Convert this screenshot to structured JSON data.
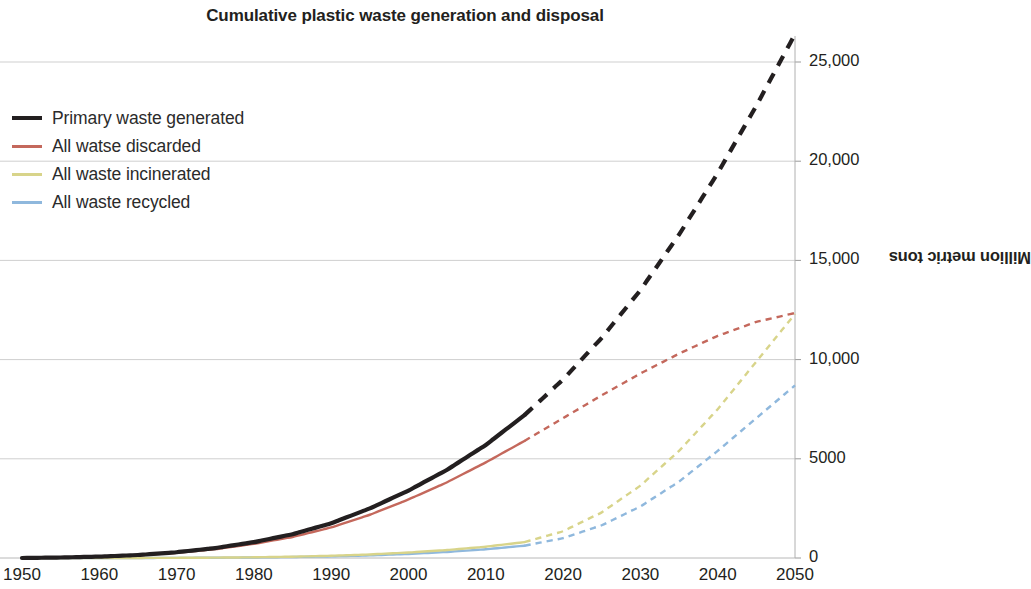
{
  "chart_data": {
    "type": "line",
    "title": "Cumulative plastic waste generation and disposal",
    "xlabel": "",
    "ylabel": "Million metric tons",
    "xlim": [
      1950,
      2050
    ],
    "ylim": [
      0,
      27000
    ],
    "grid": true,
    "legend_position": "top-left",
    "x_ticks": [
      "1950",
      "1960",
      "1970",
      "1980",
      "1990",
      "2000",
      "2010",
      "2020",
      "2030",
      "2040",
      "2050"
    ],
    "x_tick_values": [
      1950,
      1960,
      1970,
      1980,
      1990,
      2000,
      2010,
      2020,
      2030,
      2040,
      2050
    ],
    "y_ticks": [
      "0",
      "5000",
      "10,000",
      "15,000",
      "20,000",
      "25,000"
    ],
    "y_tick_values": [
      0,
      5000,
      10000,
      15000,
      20000,
      25000
    ],
    "historical_end_year": 2015,
    "note": "Solid segments are historical (1950-2015); dashed segments are projections (2015-2050).",
    "x": [
      1950,
      1955,
      1960,
      1965,
      1970,
      1975,
      1980,
      1985,
      1990,
      1995,
      2000,
      2005,
      2010,
      2015,
      2020,
      2025,
      2030,
      2035,
      2040,
      2045,
      2050
    ],
    "series": [
      {
        "name": "Primary waste generated",
        "color": "#231f20",
        "width": 4.2,
        "values": [
          0,
          25,
          70,
          150,
          290,
          500,
          800,
          1200,
          1750,
          2500,
          3400,
          4450,
          5700,
          7200,
          9000,
          11100,
          13500,
          16300,
          19400,
          22800,
          26400
        ]
      },
      {
        "name": "All watse discarded",
        "color": "#c4685c",
        "width": 2.4,
        "values": [
          0,
          22,
          62,
          133,
          258,
          445,
          712,
          1060,
          1540,
          2180,
          2950,
          3820,
          4820,
          5900,
          7050,
          8200,
          9300,
          10300,
          11200,
          11900,
          12350
        ]
      },
      {
        "name": "All waste incinerated",
        "color": "#d8d48a",
        "width": 2.4,
        "values": [
          0,
          0,
          1,
          3,
          8,
          18,
          36,
          66,
          112,
          180,
          275,
          400,
          570,
          800,
          1350,
          2300,
          3650,
          5400,
          7500,
          9900,
          12300
        ]
      },
      {
        "name": "All waste recycled",
        "color": "#8fb8dd",
        "width": 2.4,
        "values": [
          0,
          0,
          1,
          2,
          6,
          13,
          26,
          48,
          82,
          132,
          205,
          305,
          440,
          620,
          1000,
          1650,
          2600,
          3850,
          5400,
          7050,
          8700
        ]
      }
    ]
  },
  "axis": {
    "y_title": "Million metric tons"
  }
}
